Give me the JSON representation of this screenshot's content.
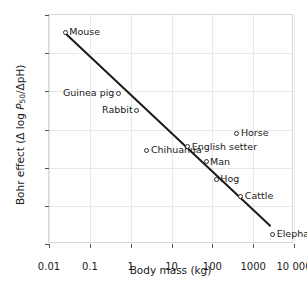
{
  "chart_data": {
    "type": "scatter",
    "title": "",
    "xlabel": "Body mass (kg)",
    "ylabel": "Bohr effect (Δ log P50/ΔpH)",
    "ylabel_parts": {
      "prefix": "Bohr effect (Δ log ",
      "italic": "P",
      "subscript": "50",
      "suffix": "/ΔpH)"
    },
    "xscale": "log",
    "xlim": [
      0.01,
      10000
    ],
    "ylim": [
      -1.0,
      -0.4
    ],
    "y_inverted": true,
    "grid": true,
    "legend": "none",
    "xticks": [
      {
        "value": 0.01,
        "label": "0.01"
      },
      {
        "value": 0.1,
        "label": "0.1"
      },
      {
        "value": 1,
        "label": "1"
      },
      {
        "value": 10,
        "label": "10"
      },
      {
        "value": 100,
        "label": "100"
      },
      {
        "value": 1000,
        "label": "1000"
      },
      {
        "value": 10000,
        "label": "10 000"
      }
    ],
    "yticks": [
      {
        "value": -1.0,
        "label": "−1.0"
      },
      {
        "value": -0.9,
        "label": "−0.9"
      },
      {
        "value": -0.8,
        "label": "−0.8"
      },
      {
        "value": -0.7,
        "label": "−0.7"
      },
      {
        "value": -0.6,
        "label": "−0.6"
      },
      {
        "value": -0.5,
        "label": "−0.5"
      },
      {
        "value": -0.4,
        "label": "−0.4"
      }
    ],
    "points": [
      {
        "label": "Mouse",
        "x": 0.025,
        "y": -0.955,
        "label_side": "right"
      },
      {
        "label": "Guinea pig",
        "x": 0.5,
        "y": -0.795,
        "label_side": "left"
      },
      {
        "label": "Rabbit",
        "x": 1.4,
        "y": -0.75,
        "label_side": "left"
      },
      {
        "label": "Chihuahua",
        "x": 2.5,
        "y": -0.645,
        "label_side": "right"
      },
      {
        "label": "English setter",
        "x": 25,
        "y": -0.655,
        "label_side": "right"
      },
      {
        "label": "Horse",
        "x": 400,
        "y": -0.69,
        "label_side": "right"
      },
      {
        "label": "Man",
        "x": 70,
        "y": -0.615,
        "label_side": "right"
      },
      {
        "label": "Hog",
        "x": 125,
        "y": -0.57,
        "label_side": "right"
      },
      {
        "label": "Cattle",
        "x": 500,
        "y": -0.525,
        "label_side": "right"
      },
      {
        "label": "Elephant",
        "x": 3000,
        "y": -0.425,
        "label_side": "right"
      }
    ],
    "trend_line": {
      "x_start": 0.025,
      "y_start": -0.952,
      "x_end": 2600,
      "y_end": -0.448,
      "color": "#1a1a1a",
      "width": 2
    }
  },
  "colors": {
    "grid": "#e9e9e9",
    "frame": "#d8d8d8",
    "marker_edge": "#2b2b2b",
    "text": "#1a1a1a",
    "background": "#ffffff"
  }
}
